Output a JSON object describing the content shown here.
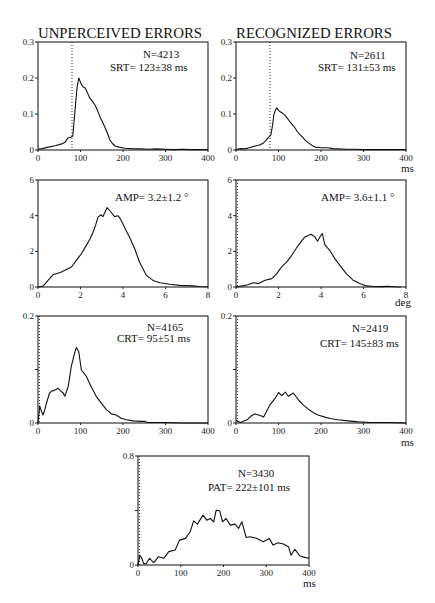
{
  "figure": {
    "column_titles": [
      "UNPERCEIVED ERRORS",
      "RECOGNIZED ERRORS"
    ]
  },
  "chart_data": [
    {
      "id": "unperceived-srt",
      "type": "line",
      "column": "UNPERCEIVED ERRORS",
      "measure": "SRT",
      "xlim": [
        0,
        400
      ],
      "ylim": [
        0,
        0.3
      ],
      "xticks": [
        0,
        100,
        200,
        300,
        400
      ],
      "xticklabels": [
        "0",
        "100",
        "200",
        "300",
        "400"
      ],
      "yticks": [
        0,
        0.1,
        0.2,
        0.3
      ],
      "yticklabels": [
        "0",
        "0.1",
        "0.2",
        "0.3"
      ],
      "xlabel": "",
      "vline": 80,
      "annotations": [
        "N=4213",
        "SRT= 123±38 ms"
      ],
      "points": [
        [
          0,
          0.002
        ],
        [
          10,
          0.004
        ],
        [
          24,
          0.008
        ],
        [
          40,
          0.012
        ],
        [
          56,
          0.017
        ],
        [
          64,
          0.022
        ],
        [
          70,
          0.033
        ],
        [
          78,
          0.036
        ],
        [
          82,
          0.039
        ],
        [
          87,
          0.11
        ],
        [
          92,
          0.175
        ],
        [
          96,
          0.2
        ],
        [
          101,
          0.185
        ],
        [
          106,
          0.175
        ],
        [
          111,
          0.172
        ],
        [
          116,
          0.16
        ],
        [
          122,
          0.144
        ],
        [
          128,
          0.135
        ],
        [
          134,
          0.125
        ],
        [
          140,
          0.11
        ],
        [
          146,
          0.092
        ],
        [
          152,
          0.077
        ],
        [
          158,
          0.061
        ],
        [
          164,
          0.045
        ],
        [
          169,
          0.028
        ],
        [
          175,
          0.018
        ],
        [
          181,
          0.011
        ],
        [
          190,
          0.008
        ],
        [
          205,
          0.005
        ],
        [
          220,
          0.004
        ],
        [
          240,
          0.003
        ],
        [
          260,
          0.002
        ],
        [
          280,
          0.003
        ],
        [
          300,
          0.002
        ],
        [
          320,
          0.001
        ],
        [
          340,
          0.002
        ],
        [
          360,
          0.001
        ],
        [
          380,
          0.001
        ],
        [
          400,
          0.001
        ]
      ]
    },
    {
      "id": "recognized-srt",
      "type": "line",
      "column": "RECOGNIZED ERRORS",
      "measure": "SRT",
      "xlim": [
        0,
        400
      ],
      "ylim": [
        0,
        0.3
      ],
      "xticks": [
        0,
        100,
        200,
        300,
        400
      ],
      "xticklabels": [
        "0",
        "100",
        "200",
        "300",
        "400"
      ],
      "yticks": [
        0,
        0.1,
        0.2,
        0.3
      ],
      "yticklabels": [
        "0",
        "0.1",
        "0.2",
        "0.3"
      ],
      "xlabel": "ms",
      "vline": 80,
      "annotations": [
        "N=2611",
        "SRT= 131±53 ms"
      ],
      "points": [
        [
          0,
          0.001
        ],
        [
          10,
          0.004
        ],
        [
          21,
          0.003
        ],
        [
          33,
          0.007
        ],
        [
          45,
          0.011
        ],
        [
          55,
          0.014
        ],
        [
          64,
          0.019
        ],
        [
          70,
          0.026
        ],
        [
          75,
          0.033
        ],
        [
          82,
          0.042
        ],
        [
          86,
          0.07
        ],
        [
          89,
          0.097
        ],
        [
          93,
          0.112
        ],
        [
          96,
          0.117
        ],
        [
          100,
          0.11
        ],
        [
          104,
          0.106
        ],
        [
          110,
          0.102
        ],
        [
          115,
          0.097
        ],
        [
          121,
          0.088
        ],
        [
          127,
          0.078
        ],
        [
          133,
          0.07
        ],
        [
          139,
          0.061
        ],
        [
          145,
          0.05
        ],
        [
          151,
          0.042
        ],
        [
          157,
          0.035
        ],
        [
          162,
          0.028
        ],
        [
          168,
          0.022
        ],
        [
          174,
          0.017
        ],
        [
          180,
          0.012
        ],
        [
          186,
          0.008
        ],
        [
          200,
          0.006
        ],
        [
          216,
          0.006
        ],
        [
          228,
          0.004
        ],
        [
          240,
          0.003
        ],
        [
          260,
          0.002
        ],
        [
          280,
          0.002
        ],
        [
          300,
          0.001
        ],
        [
          330,
          0.001
        ],
        [
          360,
          0.001
        ],
        [
          400,
          0.001
        ]
      ]
    },
    {
      "id": "unperceived-amp",
      "type": "line",
      "column": "UNPERCEIVED ERRORS",
      "measure": "AMP",
      "xlim": [
        0,
        8
      ],
      "ylim": [
        0,
        6
      ],
      "xticks": [
        0,
        2,
        4,
        6,
        8
      ],
      "xticklabels": [
        "0",
        "2",
        "4",
        "6",
        "8"
      ],
      "yticks": [
        0,
        2,
        4,
        6
      ],
      "yticklabels": [
        "0",
        "2",
        "4",
        "6"
      ],
      "xlabel": "",
      "vline": null,
      "annotations": [
        "AMP= 3.2±1.2 °"
      ],
      "points": [
        [
          0,
          0
        ],
        [
          0.24,
          0.05
        ],
        [
          0.47,
          0.37
        ],
        [
          0.71,
          0.69
        ],
        [
          0.9,
          0.76
        ],
        [
          1.1,
          0.84
        ],
        [
          1.4,
          1.02
        ],
        [
          1.57,
          1.12
        ],
        [
          1.8,
          1.49
        ],
        [
          2.04,
          1.86
        ],
        [
          2.27,
          2.32
        ],
        [
          2.45,
          2.7
        ],
        [
          2.59,
          3.07
        ],
        [
          2.72,
          3.5
        ],
        [
          2.82,
          3.9
        ],
        [
          2.95,
          4.05
        ],
        [
          3.06,
          3.95
        ],
        [
          3.25,
          4.46
        ],
        [
          3.45,
          4.18
        ],
        [
          3.6,
          3.95
        ],
        [
          3.76,
          4.0
        ],
        [
          3.88,
          3.8
        ],
        [
          4.0,
          3.53
        ],
        [
          4.15,
          3.15
        ],
        [
          4.31,
          2.79
        ],
        [
          4.55,
          2.14
        ],
        [
          4.78,
          1.39
        ],
        [
          4.95,
          1.0
        ],
        [
          5.1,
          0.65
        ],
        [
          5.41,
          0.37
        ],
        [
          5.73,
          0.24
        ],
        [
          6.2,
          0.15
        ],
        [
          6.67,
          0.09
        ],
        [
          7.3,
          0.06
        ],
        [
          7.6,
          0.03
        ],
        [
          8,
          0.01
        ]
      ]
    },
    {
      "id": "recognized-amp",
      "type": "line",
      "column": "RECOGNIZED ERRORS",
      "measure": "AMP",
      "xlim": [
        0,
        8
      ],
      "ylim": [
        0,
        6
      ],
      "xticks": [
        0,
        2,
        4,
        6,
        8
      ],
      "xticklabels": [
        "0",
        "2",
        "4",
        "6",
        "8"
      ],
      "yticks": [
        0,
        2,
        4,
        6
      ],
      "yticklabels": [
        "0",
        "2",
        "4",
        "6"
      ],
      "xlabel": "deg",
      "vline": 0,
      "annotations": [
        "AMP= 3.6±1.1 °"
      ],
      "points": [
        [
          0,
          0
        ],
        [
          0.44,
          0.09
        ],
        [
          0.83,
          0.24
        ],
        [
          1.06,
          0.19
        ],
        [
          1.37,
          0.38
        ],
        [
          1.68,
          0.47
        ],
        [
          1.92,
          0.75
        ],
        [
          2.15,
          1.13
        ],
        [
          2.39,
          1.41
        ],
        [
          2.62,
          1.78
        ],
        [
          2.93,
          2.34
        ],
        [
          3.24,
          2.81
        ],
        [
          3.53,
          2.96
        ],
        [
          3.71,
          2.81
        ],
        [
          3.84,
          2.57
        ],
        [
          3.95,
          2.81
        ],
        [
          4.06,
          3.0
        ],
        [
          4.18,
          2.38
        ],
        [
          4.41,
          2.06
        ],
        [
          4.65,
          1.59
        ],
        [
          4.88,
          1.22
        ],
        [
          5.19,
          0.75
        ],
        [
          5.51,
          0.38
        ],
        [
          5.82,
          0.19
        ],
        [
          6.13,
          0.06
        ],
        [
          6.5,
          0.03
        ],
        [
          6.83,
          0.02
        ],
        [
          7.14,
          0.04
        ],
        [
          7.5,
          0.01
        ],
        [
          7.77,
          0
        ]
      ]
    },
    {
      "id": "unperceived-crt",
      "type": "line",
      "column": "UNPERCEIVED ERRORS",
      "measure": "CRT",
      "xlim": [
        0,
        400
      ],
      "ylim": [
        0,
        0.2
      ],
      "xticks": [
        0,
        100,
        200,
        300,
        400
      ],
      "xticklabels": [
        "0",
        "100",
        "200",
        "300",
        "400"
      ],
      "yticks": [
        0,
        0.1,
        0.2
      ],
      "yticklabels": [
        "0",
        "",
        "0.2"
      ],
      "xlabel": "",
      "vline": 0,
      "annotations": [
        "N=4165",
        "CRT= 95±51 ms"
      ],
      "points": [
        [
          0,
          0
        ],
        [
          4,
          0.032
        ],
        [
          8,
          0.022
        ],
        [
          12,
          0.015
        ],
        [
          16,
          0.025
        ],
        [
          20,
          0.037
        ],
        [
          27,
          0.056
        ],
        [
          33,
          0.06
        ],
        [
          39,
          0.061
        ],
        [
          47,
          0.065
        ],
        [
          53,
          0.06
        ],
        [
          59,
          0.056
        ],
        [
          63,
          0.05
        ],
        [
          71,
          0.068
        ],
        [
          78,
          0.105
        ],
        [
          86,
          0.13
        ],
        [
          90,
          0.141
        ],
        [
          96,
          0.133
        ],
        [
          102,
          0.099
        ],
        [
          108,
          0.093
        ],
        [
          114,
          0.087
        ],
        [
          125,
          0.068
        ],
        [
          137,
          0.05
        ],
        [
          149,
          0.037
        ],
        [
          161,
          0.025
        ],
        [
          173,
          0.017
        ],
        [
          184,
          0.015
        ],
        [
          196,
          0.009
        ],
        [
          208,
          0.006
        ],
        [
          224,
          0.004
        ],
        [
          240,
          0.003
        ],
        [
          251,
          0.003
        ],
        [
          259,
          0.001
        ],
        [
          278,
          0.001
        ],
        [
          300,
          0.001
        ],
        [
          340,
          0
        ],
        [
          400,
          0
        ]
      ]
    },
    {
      "id": "recognized-crt",
      "type": "line",
      "column": "RECOGNIZED ERRORS",
      "measure": "CRT",
      "xlim": [
        0,
        400
      ],
      "ylim": [
        0,
        0.2
      ],
      "xticks": [
        0,
        100,
        200,
        300,
        400
      ],
      "xticklabels": [
        "0",
        "100",
        "200",
        "300",
        "400"
      ],
      "yticks": [
        0,
        0.1,
        0.2
      ],
      "yticklabels": [
        "0",
        "",
        "0.2"
      ],
      "xlabel": "ms",
      "vline": 0,
      "annotations": [
        "N=2419",
        "CRT= 145±83 ms"
      ],
      "points": [
        [
          0,
          0.005
        ],
        [
          10,
          0.001
        ],
        [
          26,
          0.006
        ],
        [
          37,
          0.014
        ],
        [
          45,
          0.017
        ],
        [
          57,
          0.014
        ],
        [
          65,
          0.011
        ],
        [
          72,
          0.022
        ],
        [
          80,
          0.034
        ],
        [
          92,
          0.046
        ],
        [
          100,
          0.057
        ],
        [
          108,
          0.051
        ],
        [
          116,
          0.058
        ],
        [
          123,
          0.05
        ],
        [
          135,
          0.056
        ],
        [
          147,
          0.043
        ],
        [
          158,
          0.034
        ],
        [
          170,
          0.026
        ],
        [
          182,
          0.019
        ],
        [
          193,
          0.015
        ],
        [
          209,
          0.011
        ],
        [
          224,
          0.008
        ],
        [
          240,
          0.006
        ],
        [
          263,
          0.004
        ],
        [
          287,
          0.002
        ],
        [
          318,
          0.001
        ],
        [
          360,
          0.001
        ],
        [
          400,
          0
        ]
      ]
    },
    {
      "id": "pat",
      "type": "line",
      "column": "",
      "measure": "PAT",
      "xlim": [
        0,
        400
      ],
      "ylim": [
        0,
        0.8
      ],
      "xticks": [
        0,
        100,
        200,
        300,
        400
      ],
      "xticklabels": [
        "0",
        "100",
        "200",
        "300",
        "400"
      ],
      "yticks": [
        0,
        0.4,
        0.8
      ],
      "yticklabels": [
        "0",
        "",
        "0.8"
      ],
      "xlabel": "ms",
      "vline": 0,
      "annotations": [
        "N=3430",
        "PAT= 222±101 ms"
      ],
      "points": [
        [
          0,
          0
        ],
        [
          4,
          0.073
        ],
        [
          9,
          0.049
        ],
        [
          13,
          0.012
        ],
        [
          19,
          0.007
        ],
        [
          27,
          0.049
        ],
        [
          37,
          0.017
        ],
        [
          48,
          0.061
        ],
        [
          60,
          0.049
        ],
        [
          72,
          0.098
        ],
        [
          87,
          0.11
        ],
        [
          97,
          0.183
        ],
        [
          111,
          0.195
        ],
        [
          122,
          0.244
        ],
        [
          130,
          0.324
        ],
        [
          139,
          0.3
        ],
        [
          152,
          0.366
        ],
        [
          161,
          0.329
        ],
        [
          169,
          0.341
        ],
        [
          177,
          0.317
        ],
        [
          183,
          0.402
        ],
        [
          191,
          0.398
        ],
        [
          198,
          0.317
        ],
        [
          206,
          0.341
        ],
        [
          216,
          0.293
        ],
        [
          227,
          0.3
        ],
        [
          235,
          0.268
        ],
        [
          243,
          0.317
        ],
        [
          253,
          0.202
        ],
        [
          262,
          0.207
        ],
        [
          278,
          0.195
        ],
        [
          293,
          0.171
        ],
        [
          307,
          0.195
        ],
        [
          316,
          0.146
        ],
        [
          328,
          0.163
        ],
        [
          340,
          0.154
        ],
        [
          352,
          0.134
        ],
        [
          358,
          0.073
        ],
        [
          367,
          0.115
        ],
        [
          379,
          0.066
        ],
        [
          390,
          0.056
        ],
        [
          400,
          0.049
        ]
      ]
    }
  ]
}
